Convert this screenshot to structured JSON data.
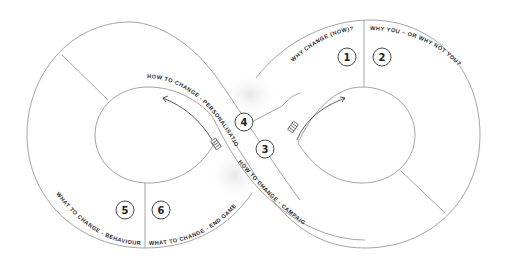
{
  "diagram": {
    "type": "infinity-loop",
    "sections": [
      {
        "number": "1",
        "label": "WHY CHANGE (NOW)?"
      },
      {
        "number": "2",
        "label": "WHY YOU – OR WHY NOT YOU?"
      },
      {
        "number": "3",
        "label": "HOW TO CHANGE - CAMPAIGN"
      },
      {
        "number": "4",
        "label": "HOW TO CHANGE - PERSONALISATION"
      },
      {
        "number": "5",
        "label": "WHAT TO CHANGE - BEHAVIOUR"
      },
      {
        "number": "6",
        "label": "WHAT TO CHANGE - END GAME"
      }
    ],
    "colors": {
      "line": "#9a9a9a",
      "text": "#2a2a2a",
      "background": "#ffffff"
    }
  }
}
